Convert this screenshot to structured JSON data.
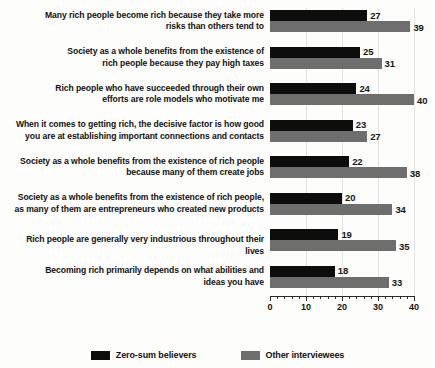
{
  "chart_data": {
    "type": "bar",
    "orientation": "horizontal",
    "title": "",
    "xlabel": "",
    "ylabel": "",
    "xlim": [
      0,
      40
    ],
    "grid": true,
    "legend_position": "bottom",
    "xticks": [
      0,
      10,
      20,
      30,
      40
    ],
    "xtick_labels": [
      "0",
      "10",
      "20",
      "30",
      "40"
    ],
    "minor_tick_step": 2,
    "categories": [
      "Many rich people become rich because they take more risks than others tend to",
      "Society as a whole benefits from the existence of rich people because they pay high taxes",
      "Rich people who have succeeded through their own efforts are role models who motivate me",
      "When it comes to getting rich, the decisive factor is how good you are at establishing important connections and contacts",
      "Society as a whole benefits from the existence of rich people because many of them create jobs",
      "Society as a whole benefits from the existence of rich people, as many of them are entrepreneurs who created new products",
      "Rich people are generally very industrious throughout their lives",
      "Becoming rich primarily depends on what abilities and ideas you have"
    ],
    "category_lines": [
      [
        "Many rich people become rich because they take more",
        "risks than others tend to"
      ],
      [
        "Society as a whole benefits from the existence of",
        "rich people because they pay high taxes"
      ],
      [
        "Rich people who have succeeded through their own",
        "efforts are role models who motivate me"
      ],
      [
        "When it comes to getting rich, the decisive factor is how good",
        "you are at establishing important connections and contacts"
      ],
      [
        "Society as a whole benefits from the existence of rich people",
        "because many of them create jobs"
      ],
      [
        "Society as a whole benefits from the existence of rich people,",
        "as many of them are entrepreneurs who created new products"
      ],
      [
        "Rich people are generally very industrious throughout their lives"
      ],
      [
        "Becoming rich primarily depends on what abilities and",
        "ideas you have"
      ]
    ],
    "series": [
      {
        "name": "Zero-sum believers",
        "color": "#0d0d0d",
        "values": [
          27,
          25,
          24,
          23,
          22,
          20,
          19,
          18
        ]
      },
      {
        "name": "Other interviewees",
        "color": "#6e6e6e",
        "values": [
          39,
          31,
          40,
          27,
          38,
          34,
          35,
          33
        ]
      }
    ]
  },
  "legend": {
    "items": [
      {
        "label": "Zero-sum believers",
        "color": "#0d0d0d"
      },
      {
        "label": "Other interviewees",
        "color": "#6e6e6e"
      }
    ]
  },
  "colors": {
    "primary": "#0d0d0d",
    "secondary": "#6e6e6e",
    "axis": "#2a2a2a",
    "grid": "#e2e2e0",
    "background": "#fdfdfc",
    "text": "#111111"
  }
}
